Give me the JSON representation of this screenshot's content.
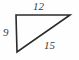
{
  "figure": {
    "type": "right-triangle-diagram",
    "background_color": "#fefefe",
    "stroke_color": "#2b2b2b",
    "label_color": "#3a3a3a",
    "vertices": {
      "top_left": {
        "x": 16,
        "y": 15
      },
      "top_right": {
        "x": 70,
        "y": 15
      },
      "bottom_left": {
        "x": 17,
        "y": 52
      }
    },
    "labels": {
      "top_side": "12",
      "left_side": "9",
      "hypotenuse": "15"
    }
  }
}
